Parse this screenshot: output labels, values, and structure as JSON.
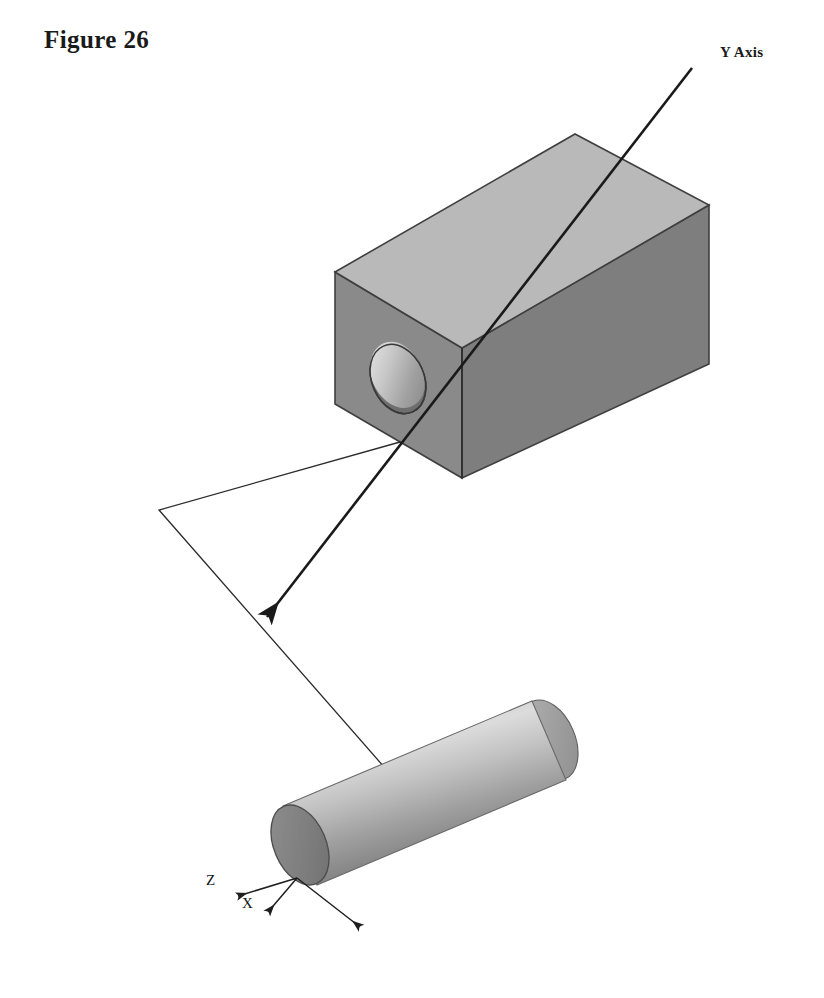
{
  "figure": {
    "title": "Figure 26",
    "kind": "isometric-technical-illustration",
    "background_color": "#ffffff"
  },
  "labels": {
    "y_axis": "Y Axis",
    "triad_z": "Z",
    "triad_x": "X"
  },
  "colors": {
    "box_top_face": "#b9b9b9",
    "box_right_face": "#7e7e7e",
    "box_left_face": "#8a8a8a",
    "box_outline": "#3a3a3a",
    "hole_shadow": "#6e6e6e",
    "hole_bore_light": "#d8d8d8",
    "cylinder_light": "#d4d4d4",
    "cylinder_mid": "#a8a8a8",
    "cylinder_dark": "#6f6f6f",
    "cylinder_cap": "#858585",
    "line_color": "#1a1a1a",
    "leader_color": "#2b2b2b",
    "text_color": "#1a1a1a"
  },
  "geometry": {
    "box": {
      "description": "rectangular block with a through hole on the near-left end face",
      "top_face_points": "335,272 575,134 709,205 462,348",
      "right_face_points": "462,348 709,205 709,364 462,478",
      "left_face_points": "335,272 462,348 462,478 335,404",
      "hole_center_x": 398,
      "hole_center_y": 379,
      "hole_rx": 26,
      "hole_ry": 36,
      "hole_rotation_deg": -24
    },
    "cylinder": {
      "description": "round bar angled from lower-left to upper-right",
      "near_cap_cx": 300,
      "near_cap_cy": 845,
      "far_cap_cx": 549,
      "far_cap_cy": 740,
      "cap_rx": 26,
      "cap_ry": 42,
      "axis_angle_deg": -23
    },
    "y_axis_line": {
      "start_x": 692,
      "start_y": 68,
      "end_x": 267,
      "end_y": 617,
      "has_arrowhead_at_end": true,
      "stroke_width": 2.6
    },
    "leader_polyline": {
      "points": "400,442 159,510 392,776",
      "stroke_width": 1.3
    },
    "triad": {
      "origin_x": 297,
      "origin_y": 878,
      "arms": [
        {
          "name": "Z",
          "tip_x": 236,
          "tip_y": 897
        },
        {
          "name": "X",
          "tip_x": 266,
          "tip_y": 913
        },
        {
          "name": "Y",
          "tip_x": 363,
          "tip_y": 929
        }
      ]
    }
  }
}
